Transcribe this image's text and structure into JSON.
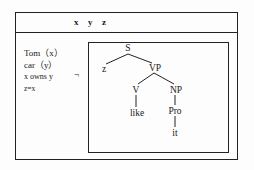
{
  "drs": {
    "referents": [
      "x",
      "y",
      "z"
    ],
    "conditions": [
      "Tom（x）",
      "car（y）",
      "x owns y",
      "z=x"
    ],
    "negation_symbol": "¬",
    "embedded_tree": {
      "nodes": {
        "S": "S",
        "z": "z",
        "VP": "VP",
        "V": "V",
        "NP": "NP",
        "like": "like",
        "Pro": "Pro",
        "it": "it"
      },
      "edges": [
        [
          "S",
          "z"
        ],
        [
          "S",
          "VP"
        ],
        [
          "VP",
          "V"
        ],
        [
          "VP",
          "NP"
        ],
        [
          "V",
          "like"
        ],
        [
          "NP",
          "Pro"
        ],
        [
          "Pro",
          "it"
        ]
      ]
    }
  }
}
